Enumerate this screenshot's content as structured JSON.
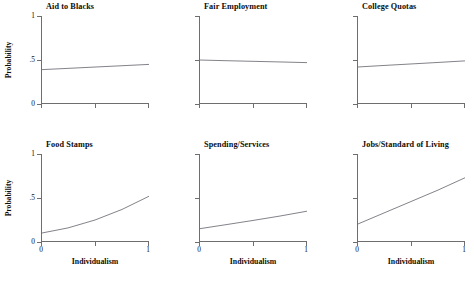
{
  "figure": {
    "y_axis_label": "Probability",
    "x_axis_label": "Individualism",
    "y_ticks": [
      "0",
      ".5",
      "1"
    ],
    "x_ticks": [
      "0",
      "1"
    ],
    "line_color": "#6b6b74",
    "axis_color": "#6e6e6e"
  },
  "chart_data": {
    "type": "line",
    "title": "",
    "xlabel": "Individualism",
    "ylabel": "Probability",
    "xlim": [
      0,
      1
    ],
    "ylim": [
      0,
      1
    ],
    "grid": false,
    "legend": "none",
    "layout": "2 rows x 3 columns of small-multiple panels",
    "x_tick_values": [
      0,
      1
    ],
    "y_tick_values": [
      0,
      0.5,
      1
    ],
    "y_tick_labels": [
      "0",
      ".5",
      "1"
    ],
    "panels": [
      {
        "title": "Aid to Blacks",
        "row": 0,
        "col": 0,
        "x": [
          0,
          0.25,
          0.5,
          0.75,
          1
        ],
        "values": [
          0.39,
          0.405,
          0.42,
          0.435,
          0.45
        ]
      },
      {
        "title": "Fair Employment",
        "row": 0,
        "col": 1,
        "x": [
          0,
          0.25,
          0.5,
          0.75,
          1
        ],
        "values": [
          0.5,
          0.492,
          0.485,
          0.478,
          0.47
        ]
      },
      {
        "title": "College Quotas",
        "row": 0,
        "col": 2,
        "x": [
          0,
          0.25,
          0.5,
          0.75,
          1
        ],
        "values": [
          0.42,
          0.438,
          0.455,
          0.472,
          0.49
        ]
      },
      {
        "title": "Food Stamps",
        "row": 1,
        "col": 0,
        "x": [
          0,
          0.25,
          0.5,
          0.75,
          1
        ],
        "values": [
          0.1,
          0.16,
          0.25,
          0.37,
          0.52
        ]
      },
      {
        "title": "Spending/Services",
        "row": 1,
        "col": 1,
        "x": [
          0,
          0.25,
          0.5,
          0.75,
          1
        ],
        "values": [
          0.15,
          0.197,
          0.245,
          0.295,
          0.35
        ]
      },
      {
        "title": "Jobs/Standard of Living",
        "row": 1,
        "col": 2,
        "x": [
          0,
          0.25,
          0.5,
          0.75,
          1
        ],
        "values": [
          0.2,
          0.33,
          0.46,
          0.59,
          0.73
        ]
      }
    ]
  }
}
